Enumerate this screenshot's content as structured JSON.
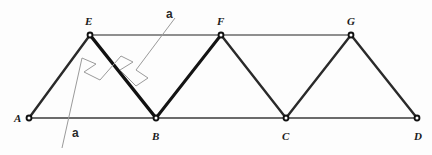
{
  "figure": {
    "kind": "truss-diagram",
    "background_color": "#fdfdfd",
    "width": 432,
    "height": 155
  },
  "colors": {
    "member_dark": "#1a1a1a",
    "member_gray": "#5a5a5a",
    "chord_gray": "#6b6b6b",
    "section_line": "#9a9a9a",
    "node_fill": "#111111",
    "node_ring": "#000000",
    "label_text": "#1a1a1a"
  },
  "nodes": [
    {
      "id": "A",
      "label": "A",
      "x": 29,
      "y": 118,
      "label_x": 14,
      "label_y": 113,
      "chord": "bottom"
    },
    {
      "id": "B",
      "label": "B",
      "x": 156,
      "y": 118,
      "label_x": 152,
      "label_y": 131,
      "chord": "bottom"
    },
    {
      "id": "C",
      "label": "C",
      "x": 286,
      "y": 118,
      "label_x": 282,
      "label_y": 131,
      "chord": "bottom"
    },
    {
      "id": "D",
      "label": "D",
      "x": 417,
      "y": 118,
      "label_x": 414,
      "label_y": 131,
      "chord": "bottom"
    },
    {
      "id": "E",
      "label": "E",
      "x": 90,
      "y": 35,
      "label_x": 85,
      "label_y": 16,
      "chord": "top"
    },
    {
      "id": "F",
      "label": "F",
      "x": 221,
      "y": 35,
      "label_x": 217,
      "label_y": 16,
      "chord": "top"
    },
    {
      "id": "G",
      "label": "G",
      "x": 351,
      "y": 35,
      "label_x": 347,
      "label_y": 16,
      "chord": "top"
    }
  ],
  "members": [
    {
      "id": "AB",
      "from": "A",
      "to": "B",
      "type": "bottom-chord",
      "weight": 2.2,
      "color": "#6b6b6b"
    },
    {
      "id": "BC",
      "from": "B",
      "to": "C",
      "type": "bottom-chord",
      "weight": 2.2,
      "color": "#6b6b6b"
    },
    {
      "id": "CD",
      "from": "C",
      "to": "D",
      "type": "bottom-chord",
      "weight": 2.2,
      "color": "#6b6b6b"
    },
    {
      "id": "EF",
      "from": "E",
      "to": "F",
      "type": "top-chord",
      "weight": 1.6,
      "color": "#6b6b6b"
    },
    {
      "id": "FG",
      "from": "F",
      "to": "G",
      "type": "top-chord",
      "weight": 1.6,
      "color": "#6b6b6b"
    },
    {
      "id": "AE",
      "from": "A",
      "to": "E",
      "type": "diagonal",
      "weight": 2.4,
      "color": "#2a2a2a"
    },
    {
      "id": "EB",
      "from": "E",
      "to": "B",
      "type": "diagonal",
      "weight": 3.4,
      "color": "#111111"
    },
    {
      "id": "BF",
      "from": "B",
      "to": "F",
      "type": "diagonal",
      "weight": 3.0,
      "color": "#141414"
    },
    {
      "id": "FC",
      "from": "F",
      "to": "C",
      "type": "diagonal",
      "weight": 2.4,
      "color": "#2a2a2a"
    },
    {
      "id": "CG",
      "from": "C",
      "to": "G",
      "type": "diagonal",
      "weight": 2.4,
      "color": "#2a2a2a"
    },
    {
      "id": "GD",
      "from": "G",
      "to": "D",
      "type": "diagonal",
      "weight": 2.4,
      "color": "#2a2a2a"
    }
  ],
  "section_cut": {
    "label": "a",
    "upper_label": {
      "text": "a",
      "x": 166,
      "y": 8
    },
    "lower_label": {
      "text": "a",
      "x": 72,
      "y": 127
    },
    "polyline": "175,18 136,70 148,78 136,86 120,70 133,62 121,56 100,80 84,72 96,64 82,58 62,148",
    "color": "#9a9a9a",
    "weight": 1.0
  },
  "node_marker": {
    "outer_radius": 3.4,
    "inner_radius": 1.5,
    "outer_fill": "#111111",
    "inner_fill": "#ffffff"
  }
}
